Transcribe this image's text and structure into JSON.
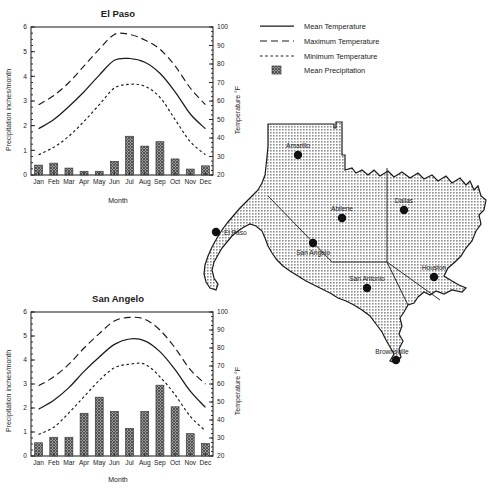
{
  "legend": {
    "items": [
      {
        "label": "Mean Temperature",
        "style": "solid-line"
      },
      {
        "label": "Maximum Temperature",
        "style": "long-dash-line"
      },
      {
        "label": "Minimum Temperature",
        "style": "short-dash-line"
      },
      {
        "label": "Mean Precipitation",
        "style": "hatched-square"
      }
    ]
  },
  "map": {
    "name": "Texas",
    "cities": [
      {
        "name": "El Paso",
        "x": 216,
        "y": 232,
        "label_dx": 8,
        "label_dy": 3,
        "anchor": "start"
      },
      {
        "name": "Amarillo",
        "x": 298,
        "y": 155,
        "label_dx": 0,
        "label_dy": -7,
        "anchor": "middle"
      },
      {
        "name": "Abilene",
        "x": 342,
        "y": 218,
        "label_dx": 0,
        "label_dy": -7,
        "anchor": "middle"
      },
      {
        "name": "Dallas",
        "x": 404,
        "y": 210,
        "label_dx": 0,
        "label_dy": -7,
        "anchor": "middle"
      },
      {
        "name": "San Angelo",
        "x": 313,
        "y": 243,
        "label_dx": 0,
        "label_dy": 12,
        "anchor": "middle"
      },
      {
        "name": "San Antonio",
        "x": 367,
        "y": 288,
        "label_dx": 0,
        "label_dy": -7,
        "anchor": "middle"
      },
      {
        "name": "Houston",
        "x": 434,
        "y": 277,
        "label_dx": 0,
        "label_dy": -7,
        "anchor": "middle"
      },
      {
        "name": "Brownsville",
        "x": 396,
        "y": 360,
        "label_dx": -4,
        "label_dy": -6,
        "anchor": "middle"
      }
    ]
  },
  "chart_data": [
    {
      "id": "el-paso",
      "type": "bar",
      "title": "El Paso",
      "xlabel": "Month",
      "ylabel": "Precipitation inches/month",
      "y2label": "Temperature °F",
      "categories": [
        "Jan",
        "Feb",
        "Mar",
        "Apr",
        "May",
        "Jun",
        "Jul",
        "Aug",
        "Sep",
        "Oct",
        "Nov",
        "Dec"
      ],
      "ylim": [
        0,
        6
      ],
      "yticks": [
        0,
        1,
        2,
        3,
        4,
        5,
        6
      ],
      "y2lim": [
        20,
        100
      ],
      "y2ticks": [
        20,
        30,
        40,
        50,
        60,
        70,
        80,
        90,
        100
      ],
      "grid": false,
      "legend_position": "top-right-external",
      "values": [
        0.4,
        0.48,
        0.28,
        0.15,
        0.15,
        0.55,
        1.57,
        1.17,
        1.35,
        0.65,
        0.24,
        0.37
      ],
      "series": [
        {
          "name": "Mean Temperature",
          "axis": "right",
          "values": [
            45,
            50,
            57,
            65,
            74,
            82,
            83,
            81,
            75,
            65,
            53,
            45
          ]
        },
        {
          "name": "Maximum Temperature",
          "axis": "right",
          "values": [
            58,
            63,
            70,
            79,
            88,
            96,
            96,
            93,
            88,
            79,
            67,
            58
          ]
        },
        {
          "name": "Minimum Temperature",
          "axis": "right",
          "values": [
            31,
            35,
            41,
            49,
            58,
            67,
            69,
            68,
            62,
            50,
            38,
            31
          ]
        }
      ]
    },
    {
      "id": "san-angelo",
      "type": "bar",
      "title": "San Angelo",
      "xlabel": "Month",
      "ylabel": "Precipitation inches/month",
      "y2label": "Temperature °F",
      "categories": [
        "Jan",
        "Feb",
        "Mar",
        "Apr",
        "May",
        "Jun",
        "Jul",
        "Aug",
        "Sep",
        "Oct",
        "Nov",
        "Dec"
      ],
      "ylim": [
        0,
        6
      ],
      "yticks": [
        0,
        1,
        2,
        3,
        4,
        5,
        6
      ],
      "y2lim": [
        20,
        100
      ],
      "y2ticks": [
        20,
        30,
        40,
        50,
        60,
        70,
        80,
        90,
        100
      ],
      "grid": false,
      "legend_position": "top-right-external",
      "values": [
        0.55,
        0.78,
        0.78,
        1.78,
        2.45,
        1.85,
        1.15,
        1.85,
        2.95,
        2.05,
        0.93,
        0.52
      ],
      "series": [
        {
          "name": "Mean Temperature",
          "axis": "right",
          "values": [
            46,
            51,
            58,
            67,
            75,
            82,
            85,
            84,
            78,
            68,
            56,
            47
          ]
        },
        {
          "name": "Maximum Temperature",
          "axis": "right",
          "values": [
            59,
            64,
            71,
            80,
            88,
            95,
            97,
            96,
            90,
            80,
            68,
            60
          ]
        },
        {
          "name": "Minimum Temperature",
          "axis": "right",
          "values": [
            32,
            36,
            44,
            53,
            62,
            69,
            71,
            71,
            64,
            54,
            42,
            34
          ]
        }
      ]
    }
  ]
}
